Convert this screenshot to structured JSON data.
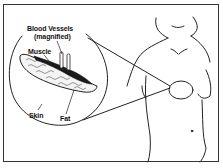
{
  "diagram": {
    "labels": {
      "blood_vessels": "Blood Vessels",
      "magnified": "(magnified)",
      "muscle": "Muscle",
      "skin": "Skin",
      "fat": "Fat"
    },
    "colors": {
      "line": "#222222",
      "muscle_fill": "#1a1a1a",
      "fat_fill": "#f2f2f2",
      "background": "#ffffff"
    }
  }
}
